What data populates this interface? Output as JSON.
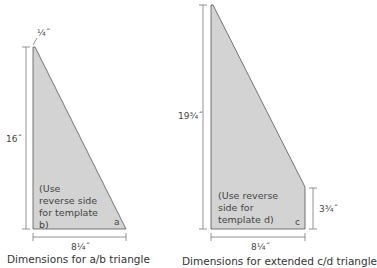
{
  "diagrams": [
    {
      "id": "ab",
      "caption": "Dimensions for a/b triangle",
      "top_width_label": "¼˝",
      "height_label": "16˝",
      "base_label": "8¼˝",
      "note": "(Use reverse side for template b)",
      "corner_label": "a"
    },
    {
      "id": "cd",
      "caption": "Dimensions for extended c/d triangle",
      "height_label": "19¾˝",
      "side_label": "3¾˝",
      "base_label": "8¼˝",
      "note": "(Use reverse side for template d)",
      "corner_label": "c"
    }
  ],
  "colors": {
    "fill": "#d3d3d3",
    "stroke": "#555555",
    "dimension_line": "#666666"
  }
}
